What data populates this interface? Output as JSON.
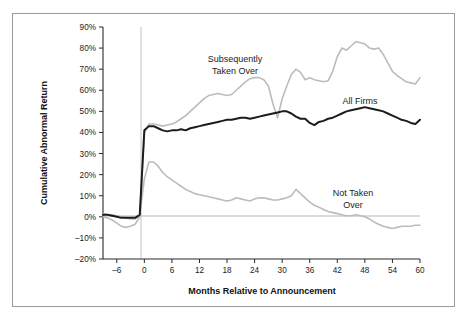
{
  "chart_data": {
    "type": "line",
    "title": "",
    "xlabel": "Months Relative to Announcement",
    "ylabel": "Cumulative Abnormal Return",
    "xlim": [
      -9,
      60
    ],
    "ylim": [
      -20,
      90
    ],
    "xticks": [
      -6,
      0,
      6,
      12,
      18,
      24,
      30,
      36,
      42,
      48,
      54,
      60
    ],
    "xtick_labels": [
      "–6",
      "0",
      "6",
      "12",
      "18",
      "24",
      "30",
      "36",
      "42",
      "48",
      "54",
      "60"
    ],
    "yticks": [
      -20,
      -10,
      0,
      10,
      20,
      30,
      40,
      50,
      60,
      70,
      80,
      90
    ],
    "ytick_labels": [
      "–20%",
      "–10%",
      "0%",
      "10%",
      "20%",
      "30%",
      "40%",
      "50%",
      "60%",
      "70%",
      "80%",
      "90%"
    ],
    "grid": false,
    "legend_position": "inline-annotations",
    "annotations": [
      {
        "name": "subsequently-taken-over-label",
        "text": "Subsequently\nTaken Over",
        "line1": "Subsequently",
        "line2": "Taken Over",
        "x": 18,
        "y": 76
      },
      {
        "name": "all-firms-label",
        "text": "All Firms",
        "line1": "All Firms",
        "line2": "",
        "x": 42,
        "y": 57
      },
      {
        "name": "not-taken-over-label",
        "text": "Not Taken\nOver",
        "line1": "Not Taken",
        "line2": "Over",
        "x": 40,
        "y": 11
      }
    ],
    "reference_lines": [
      {
        "name": "zero-return-line",
        "orientation": "horizontal",
        "value": 0,
        "color": "#aeaeae"
      },
      {
        "name": "announcement-month-line",
        "orientation": "vertical",
        "value": 0,
        "color": "#bdbdbd"
      }
    ],
    "colors": {
      "all_firms": "#1c1c1c",
      "subsequently_taken_over": "#bcbcbc",
      "not_taken_over": "#bcbcbc"
    },
    "x": [
      -9,
      -8,
      -7,
      -6,
      -5,
      -4,
      -3,
      -2,
      -1,
      0,
      1,
      2,
      3,
      4,
      5,
      6,
      7,
      8,
      9,
      10,
      11,
      12,
      13,
      14,
      15,
      16,
      17,
      18,
      19,
      20,
      21,
      22,
      23,
      24,
      25,
      26,
      27,
      28,
      29,
      30,
      31,
      32,
      33,
      34,
      35,
      36,
      37,
      38,
      39,
      40,
      41,
      42,
      43,
      44,
      45,
      46,
      47,
      48,
      49,
      50,
      51,
      52,
      53,
      54,
      55,
      56,
      57,
      58,
      59,
      60
    ],
    "series": [
      {
        "name": "All Firms",
        "color": "#1c1c1c",
        "values": [
          1,
          1,
          0.5,
          0,
          -0.5,
          -0.5,
          -0.5,
          -0.5,
          1,
          41,
          43,
          43,
          42,
          41,
          40.5,
          41,
          41,
          41.5,
          41,
          42,
          42.5,
          43,
          43.5,
          44,
          44.5,
          45,
          45.5,
          46,
          46,
          46.5,
          47,
          47,
          46.5,
          47,
          47.5,
          48,
          48.5,
          49,
          49.5,
          50,
          50,
          49,
          47.5,
          46.5,
          46.5,
          44.5,
          43.5,
          45,
          45.5,
          46.5,
          47,
          48,
          49,
          50,
          50.5,
          51,
          51.5,
          52,
          51.5,
          51,
          50.5,
          50,
          49,
          48,
          47,
          46,
          45.5,
          44.5,
          44,
          46
        ]
      },
      {
        "name": "Subsequently Taken Over",
        "color": "#bcbcbc",
        "values": [
          0,
          -0.5,
          -1.5,
          -3,
          -4.5,
          -5,
          -4.5,
          -3.5,
          0,
          40,
          44,
          44,
          43.5,
          43,
          43.5,
          44,
          45,
          46.5,
          48,
          50,
          52,
          54,
          56,
          57.5,
          58,
          58.5,
          58,
          57.5,
          58,
          60,
          62,
          64,
          65.5,
          66,
          66,
          65,
          62,
          53.5,
          47,
          56,
          62,
          67.5,
          70,
          68.5,
          65,
          66,
          65,
          64.5,
          64,
          64.5,
          69,
          76,
          80,
          79,
          81,
          83,
          82.5,
          82,
          80,
          79.5,
          80,
          77,
          73,
          69,
          67,
          65.5,
          64,
          63.5,
          63,
          66
        ]
      },
      {
        "name": "Not Taken Over",
        "color": "#bcbcbc",
        "values": [
          1.5,
          1,
          1,
          0.5,
          0,
          -0.5,
          -1,
          -1,
          0.5,
          18,
          26,
          26,
          24,
          21,
          19,
          17.5,
          16,
          14.5,
          13,
          12,
          11,
          10.5,
          10,
          9.5,
          9,
          8.5,
          8,
          7.5,
          8,
          9,
          8.5,
          8,
          7.5,
          8.5,
          9,
          9,
          8.5,
          8,
          8,
          8.5,
          9,
          10,
          13,
          11,
          9,
          7,
          5.5,
          4.5,
          3.5,
          2.5,
          2,
          1.5,
          1,
          0.5,
          0.5,
          1,
          0.5,
          0,
          -1,
          -2.5,
          -3.5,
          -4.5,
          -5,
          -5.5,
          -5,
          -4.5,
          -4.5,
          -4.5,
          -4,
          -4
        ]
      }
    ]
  },
  "figure": {
    "background_color": "#ffffff",
    "border_color": "#9a9a9a"
  }
}
